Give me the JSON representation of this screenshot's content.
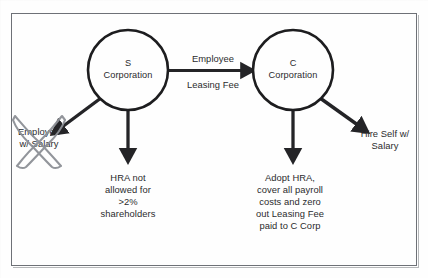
{
  "figure": {
    "kind": "flow-diagram",
    "border_color": "#6e7177",
    "background": "#fefefe",
    "ink_color": "#1d1d1f",
    "text_color": "#2b2b2d",
    "annotation_color": "#8d9096"
  },
  "nodes": [
    {
      "id": "s-corporation",
      "shape": "circle",
      "label_line1": "S",
      "label_line2": "Corporation",
      "label": "S\nCorporation",
      "cx": 128,
      "cy": 70,
      "r": 40
    },
    {
      "id": "c-corporation",
      "shape": "circle",
      "label_line1": "C",
      "label_line2": "Corporation",
      "label": "C\nCorporation",
      "cx": 293,
      "cy": 70,
      "r": 40
    }
  ],
  "edges": [
    {
      "id": "s-to-c",
      "from": "s-corporation",
      "to": "c-corporation",
      "label_above": "Employee",
      "label_below": "Leasing Fee",
      "direction": "right"
    },
    {
      "id": "s-to-employee-salary",
      "from": "s-corporation",
      "to": "employee-w-salary",
      "direction": "down-left"
    },
    {
      "id": "s-to-hra-not-allowed",
      "from": "s-corporation",
      "to": "hra-not-allowed",
      "direction": "down"
    },
    {
      "id": "c-to-adopt-hra",
      "from": "c-corporation",
      "to": "adopt-hra",
      "direction": "down"
    },
    {
      "id": "c-to-hire-self",
      "from": "c-corporation",
      "to": "hire-self",
      "direction": "down-right"
    }
  ],
  "leaves": [
    {
      "id": "employee-w-salary",
      "text": "Employee\nw/ Salary",
      "struck_out": true,
      "annotation": "x-mark"
    },
    {
      "id": "hra-not-allowed",
      "text": "HRA not\nallowed for\n>2%\nshareholders"
    },
    {
      "id": "adopt-hra",
      "text": "Adopt HRA,\ncover all payroll\ncosts and zero\nout Leasing Fee\npaid to C Corp"
    },
    {
      "id": "hire-self",
      "text": "Hire Self w/\nSalary"
    }
  ]
}
